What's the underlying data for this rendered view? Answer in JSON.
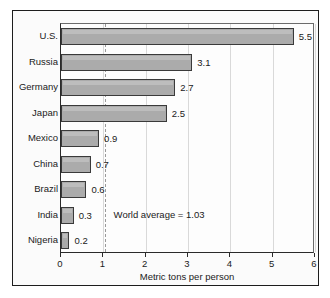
{
  "chart_data": {
    "type": "bar",
    "orientation": "horizontal",
    "title": "",
    "xlabel": "Metric tons per person",
    "ylabel": "",
    "xlim": [
      0,
      6
    ],
    "xticks": [
      "0",
      "1",
      "2",
      "3",
      "4",
      "5",
      "6"
    ],
    "grid": true,
    "legend": "none",
    "categories": [
      "U.S.",
      "Russia",
      "Germany",
      "Japan",
      "Mexico",
      "China",
      "Brazil",
      "India",
      "Nigeria"
    ],
    "values": [
      5.5,
      3.1,
      2.7,
      2.5,
      0.9,
      0.7,
      0.6,
      0.3,
      0.2
    ],
    "value_labels": [
      "5.5",
      "3.1",
      "2.7",
      "2.5",
      "0.9",
      "0.7",
      "0.6",
      "0.3",
      "0.2"
    ],
    "annotations": [
      {
        "text": "World average = 1.03",
        "value": 1.03,
        "kind": "reference-line-label"
      }
    ],
    "reference_line": {
      "value": 1.03,
      "style": "dashed",
      "color": "#9a9a9a"
    },
    "colors": {
      "bar_fill": "#ababab",
      "bar_edge": "#3a3a3a",
      "grid": "#d9d9d9",
      "axis": "#2a2a2a",
      "background": "#fbfbfb",
      "text": "#1a1a1a"
    }
  }
}
